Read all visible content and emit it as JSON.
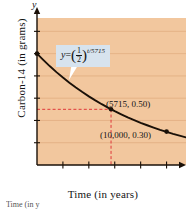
{
  "chart_data": {
    "type": "line",
    "title": "",
    "xlabel": "Time (in years)",
    "ylabel": "Carbon-14 (in grams)",
    "y_axis_symbol": "y",
    "xlim": [
      0,
      11500
    ],
    "ylim": [
      0,
      1.32
    ],
    "grid": true,
    "legend_position": "none",
    "x_ticks": [
      {
        "value": 2000,
        "label": "2,000"
      },
      {
        "value": 4000,
        "label": "4,000"
      },
      {
        "value": 6000,
        "label": "6,000"
      },
      {
        "value": 8000,
        "label": "8,000"
      },
      {
        "value": 10000,
        "label": "10,000"
      }
    ],
    "y_ticks": [
      {
        "value": 0.2,
        "label": "0.2"
      },
      {
        "value": 0.4,
        "label": "0.4"
      },
      {
        "value": 0.6,
        "label": "0.6"
      },
      {
        "value": 0.8,
        "label": "0.8"
      },
      {
        "value": 1.0,
        "label": "1.0"
      },
      {
        "value": 1.2,
        "label": "1.2"
      }
    ],
    "series": [
      {
        "name": "Carbon-14 decay",
        "equation": "y = (1/2)^(t/5715)",
        "half_life": 5715,
        "initial_mass": 1.0,
        "x": [
          0,
          500,
          1000,
          1500,
          2000,
          2500,
          3000,
          3500,
          4000,
          4500,
          5000,
          5715,
          6000,
          6500,
          7000,
          7500,
          8000,
          8500,
          9000,
          9500,
          10000,
          10500,
          11000,
          11500
        ],
        "values": [
          1.0,
          0.942,
          0.886,
          0.834,
          0.785,
          0.739,
          0.696,
          0.655,
          0.616,
          0.58,
          0.546,
          0.5,
          0.483,
          0.455,
          0.428,
          0.403,
          0.379,
          0.357,
          0.336,
          0.316,
          0.298,
          0.28,
          0.264,
          0.248
        ]
      }
    ],
    "points": [
      {
        "x": 5715,
        "y": 0.5,
        "label": "(5715, 0.50)"
      },
      {
        "x": 10000,
        "y": 0.3,
        "label": "(10,000, 0.30)"
      }
    ],
    "guide_lines": {
      "horizontal": {
        "y": 0.5,
        "style": "dashed",
        "color": "#e0383a"
      },
      "vertical": {
        "x": 5715,
        "style": "dashed",
        "color": "#e0383a"
      }
    },
    "equation_callout": {
      "lhs": "y",
      "equals": "=",
      "base_numerator": "1",
      "base_denominator": "2",
      "exponent": "t/5715"
    },
    "colors": {
      "plot_background": "#f2c79e",
      "curve": "#1a1008",
      "axis": "#1a1008",
      "gridline": "#e0ab7d",
      "guide": "#e0383a",
      "callout_background": "#d7e3ee",
      "text": "#141414"
    }
  },
  "caption": {
    "text": "Time (in y"
  }
}
